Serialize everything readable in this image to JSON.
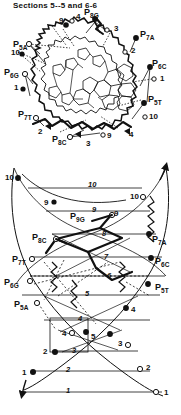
{
  "figure": {
    "title": "Sections 5--5 and 6-6",
    "type": "molecular-structure-diagram",
    "ink_color": "#111111",
    "paper_color": "#ffffff"
  },
  "panels": {
    "upper": {
      "name": "base-stacking-projection",
      "phosphate_labels": [
        {
          "id": "P5A",
          "base": "P",
          "sub": "5A",
          "x": 13,
          "y": 40
        },
        {
          "id": "P8G",
          "base": "P",
          "sub": "8G",
          "x": 84,
          "y": 14
        },
        {
          "id": "P7A",
          "base": "P",
          "sub": "7A",
          "x": 140,
          "y": 33
        },
        {
          "id": "P6C",
          "base": "P",
          "sub": "6C",
          "x": 152,
          "y": 63
        },
        {
          "id": "P5T",
          "base": "P",
          "sub": "5T",
          "x": 148,
          "y": 97
        },
        {
          "id": "P6G",
          "base": "P",
          "sub": "6G",
          "x": 6,
          "y": 70
        },
        {
          "id": "P7T",
          "base": "P",
          "sub": "7T",
          "x": 20,
          "y": 113
        },
        {
          "id": "P8C",
          "base": "P",
          "sub": "8C",
          "x": 54,
          "y": 138
        }
      ],
      "residue_numbers": [
        {
          "text": "9",
          "x": 61,
          "y": 24,
          "marker": "filled"
        },
        {
          "text": "4",
          "x": 77,
          "y": 20,
          "marker": "open"
        },
        {
          "text": "3",
          "x": 113,
          "y": 30,
          "marker": "open"
        },
        {
          "text": "2",
          "x": 130,
          "y": 52,
          "marker": "open"
        },
        {
          "text": "1",
          "x": 159,
          "y": 79,
          "marker": "open"
        },
        {
          "text": "10",
          "x": 14,
          "y": 53,
          "marker": "filled"
        },
        {
          "text": "1",
          "x": 15,
          "y": 88,
          "marker": "filled"
        },
        {
          "text": "10",
          "x": 150,
          "y": 117,
          "marker": "open"
        },
        {
          "text": "2",
          "x": 40,
          "y": 131,
          "marker": "filled"
        },
        {
          "text": "9",
          "x": 108,
          "y": 135,
          "marker": "open"
        },
        {
          "text": "4",
          "x": 128,
          "y": 134,
          "marker": "filled"
        },
        {
          "text": "3",
          "x": 88,
          "y": 142,
          "marker": "filled"
        }
      ]
    },
    "lower": {
      "name": "helical-backbone-net-diagram",
      "phosphate_labels": [
        {
          "id": "P9G",
          "base": "P",
          "sub": "9G",
          "x": 73,
          "y": 216
        },
        {
          "id": "P8C",
          "base": "P",
          "sub": "8C",
          "x": 46,
          "y": 236
        },
        {
          "id": "P7A",
          "base": "P",
          "sub": "7A",
          "x": 152,
          "y": 238
        },
        {
          "id": "P7T",
          "base": "P",
          "sub": "7T",
          "x": 18,
          "y": 260
        },
        {
          "id": "P6C",
          "base": "P",
          "sub": "6C",
          "x": 155,
          "y": 260
        },
        {
          "id": "P6G",
          "base": "P",
          "sub": "6G",
          "x": 9,
          "y": 282
        },
        {
          "id": "P5T",
          "base": "P",
          "sub": "5T",
          "x": 155,
          "y": 286
        },
        {
          "id": "P5A",
          "base": "P",
          "sub": "5A",
          "x": 19,
          "y": 307
        }
      ],
      "rung_numbers": [
        {
          "text": "10",
          "x": 90,
          "y": 186
        },
        {
          "text": "9",
          "x": 92,
          "y": 211
        },
        {
          "text": "8",
          "x": 102,
          "y": 236
        },
        {
          "text": "7",
          "x": 104,
          "y": 258
        },
        {
          "text": "6",
          "x": 107,
          "y": 277
        },
        {
          "text": "5",
          "x": 85,
          "y": 295
        },
        {
          "text": "4",
          "x": 78,
          "y": 320
        },
        {
          "text": "3",
          "x": 72,
          "y": 352
        },
        {
          "text": "2",
          "x": 66,
          "y": 371
        },
        {
          "text": "1",
          "x": 66,
          "y": 392
        }
      ],
      "vertex_numbers": [
        {
          "text": "10",
          "x": 7,
          "y": 178,
          "marker": "filled"
        },
        {
          "text": "9",
          "x": 46,
          "y": 202,
          "marker": "filled"
        },
        {
          "text": "10",
          "x": 133,
          "y": 196,
          "marker": "open"
        },
        {
          "text": "9",
          "x": 115,
          "y": 216,
          "marker": "open"
        },
        {
          "text": "4",
          "x": 131,
          "y": 310,
          "marker": "filled"
        },
        {
          "text": "4",
          "x": 64,
          "y": 333,
          "marker": "open"
        },
        {
          "text": "5",
          "x": 92,
          "y": 333,
          "marker": "filled"
        },
        {
          "text": "3",
          "x": 117,
          "y": 344,
          "marker": "open"
        },
        {
          "text": "2",
          "x": 45,
          "y": 352,
          "marker": "filled"
        },
        {
          "text": "2",
          "x": 145,
          "y": 368,
          "marker": "open"
        },
        {
          "text": "1",
          "x": 24,
          "y": 373,
          "marker": "filled"
        },
        {
          "text": "1",
          "x": 163,
          "y": 392,
          "marker": "open"
        }
      ]
    }
  }
}
